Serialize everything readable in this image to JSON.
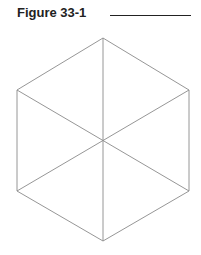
{
  "figure": {
    "title": "Figure 33-1",
    "stroke_color": "#8a8a8a",
    "shape": "hexagon-divided-into-six-triangles",
    "vertices": {
      "top": [
        103,
        38
      ],
      "upper_left": [
        17,
        90
      ],
      "upper_right": [
        189,
        90
      ],
      "lower_left": [
        17,
        191
      ],
      "lower_right": [
        189,
        191
      ],
      "bottom": [
        103,
        241
      ],
      "center": [
        103,
        140
      ]
    }
  }
}
